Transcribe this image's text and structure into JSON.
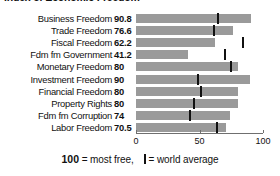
{
  "chart_data": {
    "type": "bar",
    "title": "Index of Economic Freedom",
    "xlabel": "",
    "ylabel": "",
    "xlim": [
      0,
      100
    ],
    "grid": false,
    "orientation": "horizontal",
    "categories": [
      "Business Freedom",
      "Trade Freedom",
      "Fiscal Freedom",
      "Fdm fm Government",
      "Monetary Freedom",
      "Investment Freedom",
      "Financial Freedom",
      "Property Rights",
      "Fdm fm Corruption",
      "Labor Freedom"
    ],
    "value_labels": [
      "90.8",
      "76.6",
      "62.2",
      "41.2",
      "80",
      "90",
      "80",
      "80",
      "74",
      "70.5"
    ],
    "values": [
      90.8,
      76.6,
      62.2,
      41.2,
      80,
      90,
      80,
      80,
      74,
      70.5
    ],
    "series": [
      {
        "name": "Score",
        "values": [
          90.8,
          76.6,
          62.2,
          41.2,
          80,
          90,
          80,
          80,
          74,
          70.5
        ]
      },
      {
        "name": "World average",
        "marker": true,
        "values": [
          64.5,
          61.5,
          84.0,
          70.0,
          74.5,
          48.5,
          51.5,
          45.5,
          42.5,
          63.5
        ]
      }
    ],
    "xticks": [
      0,
      50,
      100
    ],
    "xtick_labels": [
      "0",
      "50",
      "100"
    ],
    "bar_color": "#9a9a9a",
    "marker_color": "#111111"
  },
  "legend": {
    "most_free_value": "100",
    "most_free_text": " = most free,",
    "world_average_text": "= world average"
  }
}
